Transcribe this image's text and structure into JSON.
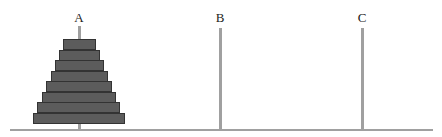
{
  "diagram": {
    "colors": {
      "disk": "#5c5c5c",
      "disk_border": "#333333",
      "peg": "#a0a0a0",
      "baseline": "#a0a0a0"
    },
    "baseline": {
      "x": 10,
      "y": 129,
      "width": 423,
      "height": 2
    },
    "pegs": [
      {
        "label": "A",
        "x": 79,
        "top": 26,
        "disks": 8
      },
      {
        "label": "B",
        "x": 220,
        "top": 28,
        "disks": 0
      },
      {
        "label": "C",
        "x": 362,
        "top": 28,
        "disks": 0
      }
    ],
    "disks": [
      {
        "index": 1,
        "peg": "A",
        "x": 63,
        "width": 33
      },
      {
        "index": 2,
        "peg": "A",
        "x": 59,
        "width": 41
      },
      {
        "index": 3,
        "peg": "A",
        "x": 55,
        "width": 49
      },
      {
        "index": 4,
        "peg": "A",
        "x": 51,
        "width": 57
      },
      {
        "index": 5,
        "peg": "A",
        "x": 46,
        "width": 66
      },
      {
        "index": 6,
        "peg": "A",
        "x": 42,
        "width": 74
      },
      {
        "index": 7,
        "peg": "A",
        "x": 37,
        "width": 83
      },
      {
        "index": 8,
        "peg": "A",
        "x": 33,
        "width": 92
      }
    ],
    "disk_height": 11,
    "stack_top": 39
  }
}
